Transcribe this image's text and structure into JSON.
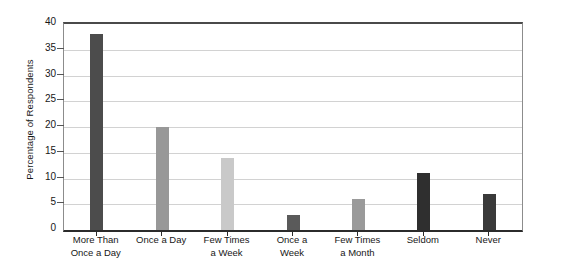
{
  "chart_data": {
    "type": "bar",
    "title": "",
    "subtitle": "",
    "xlabel": "",
    "ylabel": "Percentage of Respondents",
    "ylim": [
      0,
      40
    ],
    "ytick_step": 5,
    "ytick_labels": [
      "40",
      "35",
      "30",
      "25",
      "20",
      "15",
      "10",
      "5",
      "0"
    ],
    "grid": true,
    "legend": false,
    "categories": [
      "More Than Once a Day",
      "Once a Day",
      "Few Times a Week",
      "Once a Week",
      "Few Times a Month",
      "Seldom",
      "Never"
    ],
    "category_lines": [
      [
        "More Than",
        "Once a Day"
      ],
      [
        "Once a Day",
        ""
      ],
      [
        "Few Times",
        "a Week"
      ],
      [
        "Once a",
        "Week"
      ],
      [
        "Few Times",
        "a Month"
      ],
      [
        "Seldom",
        ""
      ],
      [
        "Never",
        ""
      ]
    ],
    "values": [
      38,
      20,
      14,
      3,
      6,
      11,
      7
    ],
    "bar_colors": [
      "#4c4c4c",
      "#989898",
      "#c9c9c9",
      "#5a5a5a",
      "#9a9a9a",
      "#2f2f2f",
      "#3a3a3a"
    ]
  },
  "colors": {
    "background": "#ffffff",
    "gridline": "#d2d2d2",
    "axis": "#2b2b2b",
    "frame": "#8c8c8c",
    "text": "#171717"
  }
}
